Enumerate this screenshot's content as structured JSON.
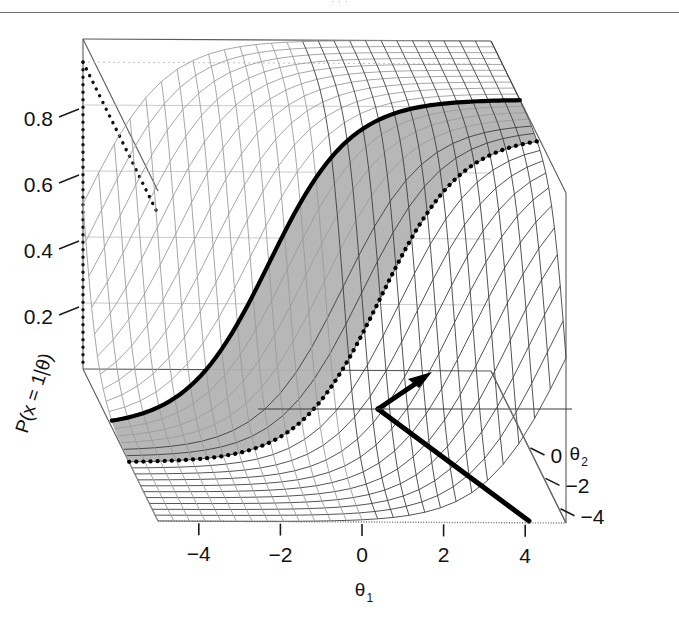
{
  "page": {
    "header_rule": true,
    "header_ghost_text": "· · ·"
  },
  "chart_data": {
    "type": "surface",
    "title": "",
    "zlabel": "P(x = 1|θ)",
    "xlabel": "θ₁",
    "ylabel": "θ₂",
    "xlabel_base": "θ",
    "xlabel_sub": "1",
    "ylabel_base": "θ",
    "ylabel_sub": "2",
    "x_ticks": [
      "−4",
      "−2",
      "0",
      "2",
      "4"
    ],
    "x_tick_values": [
      -4,
      -2,
      0,
      2,
      4
    ],
    "y_ticks": [
      "0",
      "−2",
      "−4"
    ],
    "y_tick_values": [
      0,
      -2,
      -4
    ],
    "z_ticks": [
      "0.8",
      "0.6",
      "0.4",
      "0.2"
    ],
    "z_tick_values": [
      0.8,
      0.6,
      0.4,
      0.2
    ],
    "xlim": [
      -5,
      5
    ],
    "ylim": [
      -5,
      5
    ],
    "zlim": [
      0,
      1
    ],
    "grid": true,
    "legend": null,
    "surface_function": "P = 1 / (1 + exp(-(theta1 + theta2)))",
    "mesh_n": 26,
    "shaded_band": {
      "label": "credible region band",
      "fill": "#b3b3b3",
      "left_edge": "solid thick curve",
      "right_edge": "dotted thick curve"
    },
    "annotations": [
      {
        "name": "gradient-arrow",
        "style": "thick solid arrow",
        "direction": "up-right"
      },
      {
        "name": "tangent-line",
        "style": "thick solid line",
        "direction": "down-right"
      }
    ],
    "colors": {
      "mesh": "#3a3a3a",
      "mesh_light": "#9a9a9a",
      "band_fill": "#b3b3b3",
      "box": "#5a5a5a",
      "box_dotted": "#111111",
      "grid": "#9c9c9c",
      "axis_text": "#111111",
      "background": "#ffffff"
    }
  }
}
